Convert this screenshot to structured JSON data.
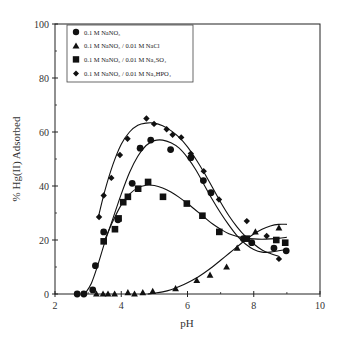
{
  "chart_data": {
    "type": "scatter",
    "title": "",
    "xlabel": "pH",
    "ylabel": "% Hg(II) Adsorbed",
    "xlim": [
      2,
      10
    ],
    "ylim": [
      0,
      100
    ],
    "x_ticks": [
      2,
      4,
      6,
      8,
      10
    ],
    "y_ticks": [
      0,
      20,
      40,
      60,
      80,
      100
    ],
    "grid": false,
    "legend_position": "upper-left",
    "series": [
      {
        "name": "0.1 M NaNO3",
        "legend_label": "0.1 M NaNO₃",
        "marker": "circle",
        "fit_curve": true,
        "x": [
          2.67,
          2.87,
          3.14,
          3.22,
          3.47,
          3.9,
          4.33,
          4.57,
          4.89,
          5.49,
          6.1,
          6.48,
          6.71,
          7.69,
          7.94,
          8.61,
          8.98
        ],
        "y": [
          0,
          0,
          1.5,
          10.5,
          23,
          27.5,
          41,
          54,
          57,
          53.5,
          50.5,
          42,
          37.5,
          20.5,
          19,
          17,
          16
        ]
      },
      {
        "name": "0.1 M NaNO3 / 0.01 M NaCl",
        "legend_label": "0.1 M NaNO₃ / 0.01 M NaCl",
        "marker": "triangle",
        "fit_curve": true,
        "x": [
          3.25,
          3.45,
          3.6,
          3.8,
          4.2,
          4.4,
          4.65,
          4.95,
          5.64,
          6.28,
          6.68,
          7.18,
          7.5,
          8.05,
          8.76
        ],
        "y": [
          0,
          0,
          0,
          0,
          0.5,
          0,
          0.5,
          1,
          2,
          5,
          7,
          10,
          17,
          23,
          24.5
        ]
      },
      {
        "name": "0.1 M NaNO3 / 0.01 M Na2SO4",
        "legend_label": "0.1 M NaNO₃ / 0.01 M Na₂SO₄",
        "marker": "square",
        "fit_curve": true,
        "x": [
          3.47,
          3.81,
          3.92,
          4.06,
          4.2,
          4.51,
          4.81,
          5.26,
          5.98,
          6.45,
          6.96,
          7.79,
          8.68,
          8.95
        ],
        "y": [
          19.5,
          24,
          28,
          34,
          36,
          39,
          41.5,
          36,
          33.5,
          29,
          23,
          20.5,
          20,
          19
        ]
      },
      {
        "name": "0.1 M NaNO3 / 0.01 M Na2HPO4",
        "legend_label": "0.1 M NaNO₃ / 0.01 M Na₂HPO₄",
        "marker": "diamond",
        "fit_curve": true,
        "x": [
          3.33,
          3.47,
          3.7,
          3.96,
          4.19,
          4.76,
          4.99,
          5.37,
          5.55,
          5.81,
          6.1,
          6.49,
          6.95,
          7.79,
          8.39,
          8.76
        ],
        "y": [
          28.5,
          36.5,
          43,
          51.5,
          57.5,
          65,
          63,
          61,
          59,
          58,
          52,
          45.5,
          35,
          27,
          21.5,
          13
        ]
      }
    ],
    "fit_curves": [
      {
        "series": "0.1 M NaNO3",
        "x": [
          2.9,
          3.1,
          3.3,
          3.5,
          3.75,
          4.0,
          4.25,
          4.5,
          4.75,
          5.0,
          5.25,
          5.5,
          5.75,
          6.0,
          6.25,
          6.5,
          6.75,
          7.0,
          7.25,
          7.5,
          7.75,
          8.0,
          8.25,
          8.5,
          8.75,
          9.0
        ],
        "y": [
          0,
          4,
          11,
          19,
          28,
          37,
          45,
          51,
          55,
          56.8,
          57,
          56,
          54,
          50.5,
          46,
          40.5,
          35,
          30,
          25.5,
          21.5,
          18.5,
          16.5,
          15.5,
          15.5,
          16,
          16.5
        ]
      },
      {
        "series": "0.1 M NaNO3 / 0.01 M NaCl",
        "x": [
          4.8,
          5.0,
          5.25,
          5.5,
          5.75,
          6.0,
          6.25,
          6.5,
          6.75,
          7.0,
          7.25,
          7.5,
          7.75,
          8.0,
          8.25,
          8.5,
          8.75,
          9.0
        ],
        "y": [
          0,
          0.3,
          0.8,
          1.6,
          2.8,
          4.2,
          5.8,
          7.8,
          10,
          12.5,
          15,
          17.5,
          20,
          22.2,
          24,
          25.2,
          25.8,
          25.8
        ]
      },
      {
        "series": "0.1 M NaNO3 / 0.01 M Na2SO4",
        "x": [
          3.5,
          3.75,
          4.0,
          4.25,
          4.5,
          4.75,
          5.0,
          5.25,
          5.5,
          5.75,
          6.0,
          6.25,
          6.5,
          6.75,
          7.0,
          7.25,
          7.5,
          7.75,
          8.0,
          8.25,
          8.5,
          8.75,
          9.0
        ],
        "y": [
          20,
          27,
          33,
          37,
          39.3,
          40.3,
          40.2,
          39.3,
          37.8,
          35.8,
          33.5,
          31,
          28.5,
          26,
          24,
          22.3,
          21.3,
          20.7,
          20.4,
          20.3,
          20.4,
          20.6,
          21
        ]
      },
      {
        "series": "0.1 M NaNO3 / 0.01 M Na2HPO4",
        "x": [
          3.3,
          3.5,
          3.75,
          4.0,
          4.25,
          4.5,
          4.75,
          5.0,
          5.25,
          5.5,
          5.75,
          6.0,
          6.25,
          6.5,
          6.75,
          7.0,
          7.25,
          7.5,
          7.75,
          8.0,
          8.25,
          8.5,
          8.75
        ],
        "y": [
          28,
          38,
          48,
          55.5,
          60,
          62.5,
          63.3,
          63.3,
          62.3,
          60.5,
          58,
          54.5,
          50,
          45,
          39.5,
          34,
          29,
          24.8,
          21.3,
          18.5,
          16.3,
          15,
          14
        ]
      }
    ]
  },
  "axes": {
    "xlabel": "pH",
    "ylabel": "% Hg(II) Adsorbed",
    "x_tick_labels": [
      "2",
      "4",
      "6",
      "8",
      "10"
    ],
    "y_tick_labels": [
      "0",
      "20",
      "40",
      "60",
      "80",
      "100"
    ]
  },
  "legend": {
    "items": [
      {
        "marker": "circle",
        "label": "0.1 M NaNO₃"
      },
      {
        "marker": "triangle",
        "label": "0.1 M NaNO₃ / 0.01 M NaCl"
      },
      {
        "marker": "square",
        "label": "0.1 M NaNO₃ / 0.01 M Na₂SO₄"
      },
      {
        "marker": "diamond",
        "label": "0.1 M NaNO₃ / 0.01 M Na₂HPO₄"
      }
    ]
  },
  "colors": {
    "marker": "#111111",
    "line": "#111111",
    "axis": "#222222",
    "text": "#333333",
    "background": "#ffffff"
  }
}
